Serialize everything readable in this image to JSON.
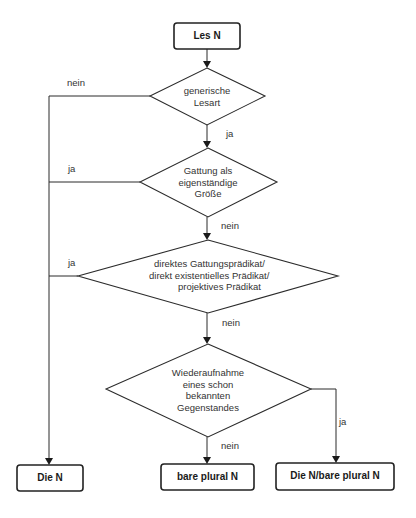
{
  "diagram": {
    "type": "flowchart",
    "start": {
      "label": "Les N"
    },
    "decisions": [
      {
        "id": "d1",
        "lines": [
          "generische",
          "Lesart"
        ]
      },
      {
        "id": "d2",
        "lines": [
          "Gattung als",
          "eigenständige",
          "Größe"
        ]
      },
      {
        "id": "d3",
        "lines": [
          "direktes Gattungsprädikat/",
          "direkt existentielles Prädikat/",
          "projektives Prädikat"
        ]
      },
      {
        "id": "d4",
        "lines": [
          "Wiederaufnahme",
          "eines schon",
          "bekannten",
          "Gegenstandes"
        ]
      }
    ],
    "outcomes": [
      {
        "id": "o1",
        "label": "Die N"
      },
      {
        "id": "o2",
        "label": "bare plural N"
      },
      {
        "id": "o3",
        "label": "Die N/bare plural N"
      }
    ],
    "edges": [
      {
        "from": "start",
        "to": "d1",
        "label": ""
      },
      {
        "from": "d1",
        "to": "o1",
        "label": "nein"
      },
      {
        "from": "d1",
        "to": "d2",
        "label": "ja"
      },
      {
        "from": "d2",
        "to": "o1",
        "label": "ja"
      },
      {
        "from": "d2",
        "to": "d3",
        "label": "nein"
      },
      {
        "from": "d3",
        "to": "o1",
        "label": "ja"
      },
      {
        "from": "d3",
        "to": "d4",
        "label": "nein"
      },
      {
        "from": "d4",
        "to": "o2",
        "label": "nein"
      },
      {
        "from": "d4",
        "to": "o3",
        "label": "ja"
      }
    ]
  }
}
